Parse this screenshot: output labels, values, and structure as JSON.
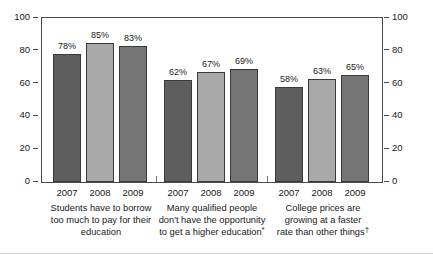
{
  "chart_data": {
    "type": "bar",
    "title": "",
    "subtitle": "",
    "xlabel": "",
    "ylabel": "",
    "ylim": [
      0,
      100
    ],
    "yticks": [
      0,
      20,
      40,
      60,
      80,
      100
    ],
    "ytick_labels": [
      "0",
      "20",
      "40",
      "60",
      "80",
      "100"
    ],
    "grid": false,
    "legend": "none",
    "right_axis": true,
    "right_ytick_labels": [
      "0",
      "20",
      "40",
      "60",
      "80",
      "100"
    ],
    "categories": [
      "2007",
      "2008",
      "2009"
    ],
    "groups": [
      {
        "caption_lines": [
          "Students have to borrow",
          "too much to pay for their",
          "education"
        ],
        "footnote_marker": "",
        "values": [
          78,
          85,
          83
        ],
        "labels": [
          "78%",
          "85%",
          "83%"
        ],
        "years": [
          "2007",
          "2008",
          "2009"
        ]
      },
      {
        "caption_lines": [
          "Many qualified people",
          "don't have the opportunity",
          "to get a higher education"
        ],
        "footnote_marker": "*",
        "values": [
          62,
          67,
          69
        ],
        "labels": [
          "62%",
          "67%",
          "69%"
        ],
        "years": [
          "2007",
          "2008",
          "2009"
        ]
      },
      {
        "caption_lines": [
          "College prices are",
          "growing at a faster",
          "rate than other things"
        ],
        "footnote_marker": "†",
        "values": [
          58,
          63,
          65
        ],
        "labels": [
          "58%",
          "63%",
          "65%"
        ],
        "years": [
          "2007",
          "2008",
          "2009"
        ]
      }
    ],
    "series": [
      {
        "name": "2007",
        "values": [
          78,
          62,
          58
        ],
        "color": "#5e5e5e"
      },
      {
        "name": "2008",
        "values": [
          85,
          67,
          63
        ],
        "color": "#a9a9a9"
      },
      {
        "name": "2009",
        "values": [
          83,
          69,
          65
        ],
        "color": "#757575"
      }
    ],
    "series_colors": [
      "#5e5e5e",
      "#a9a9a9",
      "#757575"
    ],
    "bar_edge_color": "#3a3a3a",
    "axis_color": "#4a4a4a",
    "text_color": "#1a1a1a",
    "background": "#ffffff"
  }
}
